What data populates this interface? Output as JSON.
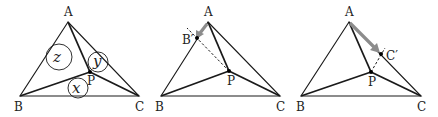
{
  "figure": {
    "panels": [
      {
        "id": "panel-1",
        "points": {
          "A": {
            "label": "A",
            "x": 68,
            "y": 22
          },
          "B": {
            "label": "B",
            "x": 20,
            "y": 96
          },
          "C": {
            "label": "C",
            "x": 139,
            "y": 96
          },
          "P": {
            "label": "P",
            "x": 90,
            "y": 72
          }
        },
        "circles": [
          {
            "label": "z",
            "cx": 59,
            "cy": 57,
            "r": 13
          },
          {
            "label": "y",
            "cx": 98,
            "cy": 62,
            "r": 10
          },
          {
            "label": "x",
            "cx": 78,
            "cy": 88,
            "r": 10
          }
        ]
      },
      {
        "id": "panel-2",
        "points": {
          "A": {
            "label": "A",
            "x": 208,
            "y": 22
          },
          "B": {
            "label": "B",
            "x": 161,
            "y": 96
          },
          "C": {
            "label": "C",
            "x": 280,
            "y": 96
          },
          "P": {
            "label": "P",
            "x": 229,
            "y": 71
          },
          "B_prime": {
            "label": "B′",
            "x": 197,
            "y": 38
          }
        },
        "arrow": {
          "from": "A",
          "to": "B′",
          "color": "#8c8c8c"
        }
      },
      {
        "id": "panel-3",
        "points": {
          "A": {
            "label": "A",
            "x": 349,
            "y": 22
          },
          "B": {
            "label": "B",
            "x": 301,
            "y": 96
          },
          "C": {
            "label": "C",
            "x": 421,
            "y": 96
          },
          "P": {
            "label": "P",
            "x": 371,
            "y": 72
          },
          "C_prime": {
            "label": "C′",
            "x": 381,
            "y": 54
          }
        },
        "arrow": {
          "from": "A",
          "to": "C′",
          "color": "#8c8c8c"
        }
      }
    ]
  }
}
